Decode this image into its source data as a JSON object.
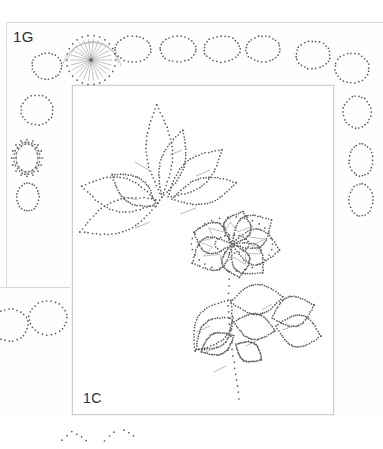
{
  "document": {
    "type": "pricking-pattern-sheet",
    "description": "Scanned dotted pricking / embroidery pattern page with floral motif inside a rectangular frame and a decorative dotted ring border",
    "background_color": "#ffffff",
    "paper_color": "#fefefe",
    "dot_color": "#5a5a5a",
    "line_color": "#a0a0a0",
    "frame_color": "#cfcfcf"
  },
  "labels": {
    "sheet_label": "1G",
    "panel_label": "1C"
  },
  "main_sheet": {
    "left": 6,
    "top": 22,
    "width": 377,
    "height": 395
  },
  "fragment_sheet": {
    "left": 0,
    "top": 287,
    "width": 70,
    "height": 130
  },
  "inner_frame": {
    "left": 72,
    "top": 85,
    "width": 260,
    "height": 328
  },
  "motifs": {
    "sunburst": {
      "cx": 91,
      "cy": 60,
      "radius": 21,
      "rays": 26,
      "arc": "upper-half"
    },
    "accent_ring": {
      "cx": 27,
      "cy": 158,
      "rx": 11,
      "ry": 14
    },
    "top_ovals": [
      {
        "cx": 133,
        "cy": 49,
        "rx": 18,
        "ry": 13
      },
      {
        "cx": 178,
        "cy": 49,
        "rx": 18,
        "ry": 13
      },
      {
        "cx": 222,
        "cy": 49,
        "rx": 18,
        "ry": 13
      },
      {
        "cx": 263,
        "cy": 49,
        "rx": 17,
        "ry": 13
      },
      {
        "cx": 313,
        "cy": 55,
        "rx": 17,
        "ry": 14
      },
      {
        "cx": 352,
        "cy": 68,
        "rx": 17,
        "ry": 15
      }
    ],
    "left_ovals": [
      {
        "cx": 47,
        "cy": 66,
        "rx": 15,
        "ry": 13
      },
      {
        "cx": 37,
        "cy": 110,
        "rx": 16,
        "ry": 15
      },
      {
        "cx": 27,
        "cy": 158,
        "rx": 13,
        "ry": 16
      },
      {
        "cx": 28,
        "cy": 197,
        "rx": 11,
        "ry": 14
      }
    ],
    "right_ovals": [
      {
        "cx": 357,
        "cy": 112,
        "rx": 14,
        "ry": 16
      },
      {
        "cx": 361,
        "cy": 160,
        "rx": 12,
        "ry": 16
      },
      {
        "cx": 361,
        "cy": 200,
        "rx": 12,
        "ry": 16
      }
    ],
    "fragment_ovals": [
      {
        "cx": 10,
        "cy": 325,
        "rx": 18,
        "ry": 16
      },
      {
        "cx": 48,
        "cy": 318,
        "rx": 19,
        "ry": 17
      }
    ],
    "flower": {
      "cx": 232,
      "cy": 244,
      "petals": 7,
      "center_rx": 17,
      "center_ry": 9
    },
    "bottom_scatter": true
  }
}
